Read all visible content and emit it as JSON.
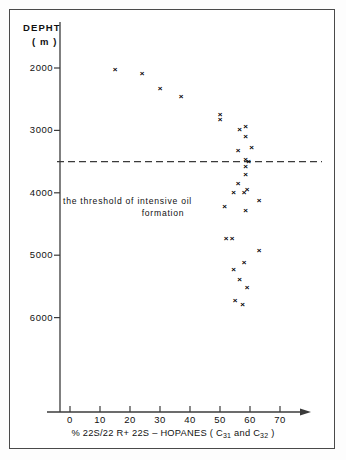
{
  "chart_data": {
    "type": "scatter",
    "title": "",
    "xlabel": "% 22S/22R+22S – HOPANES (C31 and C32)",
    "xlabel_parts": {
      "prefix": "% 22S/22 R+ 22S – HOPANES ( C",
      "sub1": "31",
      "middle": " and C",
      "sub2": "32",
      "suffix": " )"
    },
    "ylabel_line1": "DEPHT",
    "ylabel_line2": "( m )",
    "ylabel": "DEPHT (m)",
    "xlim": [
      -5,
      76
    ],
    "ylim": [
      6400,
      1700
    ],
    "y_inverted": true,
    "grid": false,
    "legend": "none",
    "xticks": [
      0,
      10,
      20,
      30,
      40,
      50,
      60,
      70
    ],
    "xtick_labels": [
      "0",
      "10",
      "20",
      "30",
      "40",
      "50",
      "60",
      "70"
    ],
    "yticks": [
      2000,
      3000,
      4000,
      5000,
      6000
    ],
    "ytick_labels": [
      "2000",
      "3000",
      "4000",
      "5000",
      "6000"
    ],
    "annotations": [
      {
        "name": "threshold-line",
        "type": "hline",
        "y": 3500,
        "style": "dashed",
        "label_line1": "the threshold of intensive oil",
        "label_line2": "formation"
      }
    ],
    "marker": "x",
    "series": [
      {
        "name": "22S/(22R+22S) hopane ratio vs depth",
        "points": [
          {
            "x": 15.0,
            "y": 2030
          },
          {
            "x": 24.0,
            "y": 2090
          },
          {
            "x": 30.0,
            "y": 2330
          },
          {
            "x": 37.0,
            "y": 2460
          },
          {
            "x": 50.0,
            "y": 2760
          },
          {
            "x": 50.0,
            "y": 2840
          },
          {
            "x": 58.5,
            "y": 2940
          },
          {
            "x": 56.5,
            "y": 2990
          },
          {
            "x": 58.5,
            "y": 3110
          },
          {
            "x": 60.5,
            "y": 3280
          },
          {
            "x": 56.0,
            "y": 3330
          },
          {
            "x": 58.5,
            "y": 3480
          },
          {
            "x": 59.5,
            "y": 3500
          },
          {
            "x": 58.5,
            "y": 3580
          },
          {
            "x": 58.5,
            "y": 3720
          },
          {
            "x": 56.0,
            "y": 3860
          },
          {
            "x": 59.0,
            "y": 3960
          },
          {
            "x": 54.5,
            "y": 4000
          },
          {
            "x": 58.0,
            "y": 4000
          },
          {
            "x": 63.0,
            "y": 4130
          },
          {
            "x": 51.5,
            "y": 4220
          },
          {
            "x": 58.5,
            "y": 4290
          },
          {
            "x": 52.0,
            "y": 4740
          },
          {
            "x": 54.0,
            "y": 4740
          },
          {
            "x": 63.0,
            "y": 4930
          },
          {
            "x": 58.0,
            "y": 5130
          },
          {
            "x": 54.5,
            "y": 5230
          },
          {
            "x": 56.5,
            "y": 5400
          },
          {
            "x": 59.0,
            "y": 5530
          },
          {
            "x": 55.0,
            "y": 5730
          },
          {
            "x": 57.5,
            "y": 5800
          }
        ]
      }
    ]
  }
}
